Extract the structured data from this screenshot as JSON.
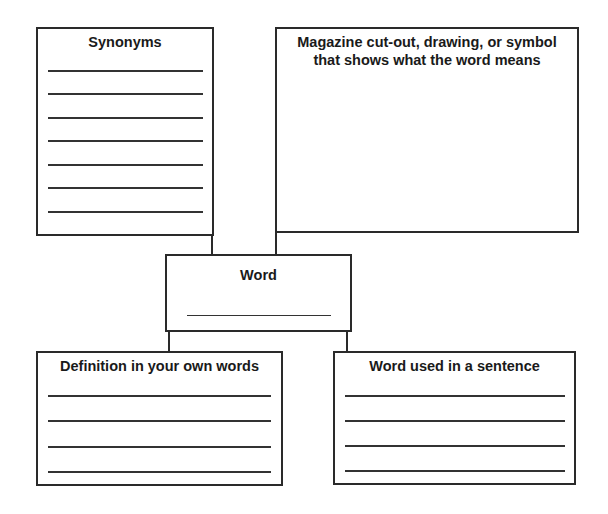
{
  "diagram": {
    "type": "vocabulary-word-map",
    "nodes": {
      "synonyms": {
        "title": "Synonyms",
        "blank_lines": 7
      },
      "picture": {
        "title_line1": "Magazine cut-out, drawing, or symbol",
        "title_line2": "that shows what the word means"
      },
      "word": {
        "title": "Word",
        "blank_lines": 1
      },
      "definition": {
        "title": "Definition in your own words",
        "blank_lines": 4
      },
      "sentence": {
        "title": "Word used in a sentence",
        "blank_lines": 4
      }
    },
    "edges": [
      [
        "synonyms",
        "word"
      ],
      [
        "picture",
        "word"
      ],
      [
        "word",
        "definition"
      ],
      [
        "word",
        "sentence"
      ]
    ],
    "colors": {
      "stroke": "#2a2a2a",
      "background": "#ffffff",
      "text": "#1a1a1a"
    }
  }
}
